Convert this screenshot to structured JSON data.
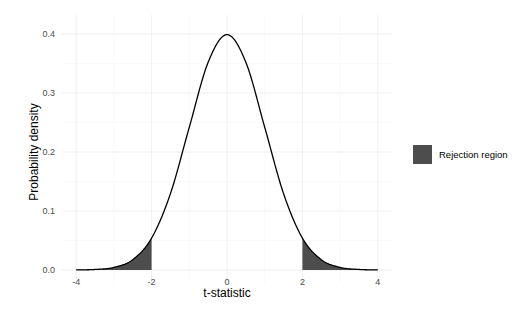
{
  "chart_data": {
    "type": "area",
    "title": "",
    "xlabel": "t-statistic",
    "ylabel": "Probability density",
    "xlim": [
      -4,
      4
    ],
    "ylim": [
      0,
      0.4
    ],
    "x_ticks": [
      -4,
      -2,
      0,
      2,
      4
    ],
    "x_tick_labels": [
      "-4",
      "-2",
      "0",
      "2",
      "4"
    ],
    "y_ticks": [
      0.0,
      0.1,
      0.2,
      0.3,
      0.4
    ],
    "y_tick_labels": [
      "0.0",
      "0.1",
      "0.2",
      "0.3",
      "0.4"
    ],
    "grid": true,
    "legend_position": "right",
    "series": [
      {
        "name": "t-distribution density",
        "type": "line",
        "color": "#000000",
        "x": [
          -4,
          -3.5,
          -3,
          -2.5,
          -2,
          -1.5,
          -1,
          -0.5,
          0,
          0.5,
          1,
          1.5,
          2,
          2.5,
          3,
          3.5,
          4
        ],
        "values": [
          0.0002,
          0.0009,
          0.0044,
          0.0175,
          0.0541,
          0.1295,
          0.242,
          0.3521,
          0.3989,
          0.3521,
          0.242,
          0.1295,
          0.0541,
          0.0175,
          0.0044,
          0.0009,
          0.0002
        ]
      }
    ],
    "shaded_regions": [
      {
        "name": "Rejection region",
        "x_from": -4,
        "x_to": -2,
        "color": "#4d4d4d"
      },
      {
        "name": "Rejection region",
        "x_from": 2,
        "x_to": 4,
        "color": "#4d4d4d"
      }
    ],
    "legend": [
      {
        "label": "Rejection region",
        "color": "#4d4d4d"
      }
    ]
  }
}
